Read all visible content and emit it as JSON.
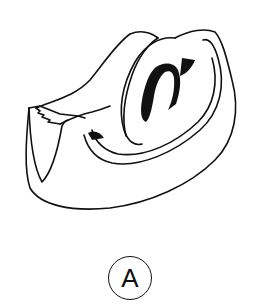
{
  "figure": {
    "label": "A",
    "stroke_color": "#111111",
    "background": "#ffffff"
  }
}
